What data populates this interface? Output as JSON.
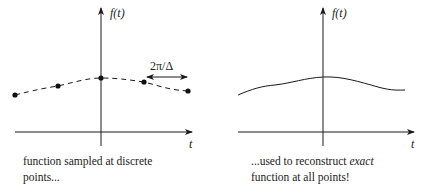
{
  "panels": [
    {
      "id": "sampled",
      "y_axis_label": "f(t)",
      "x_axis_label": "t",
      "spacing_label": "2π/Δ",
      "caption_line1": "function sampled at discrete",
      "caption_line2": "points...",
      "style": "dashed curve with sample dots",
      "sample_points": [
        {
          "x": 15,
          "y": 95
        },
        {
          "x": 58,
          "y": 86
        },
        {
          "x": 101,
          "y": 78
        },
        {
          "x": 144,
          "y": 82
        },
        {
          "x": 188,
          "y": 91
        }
      ]
    },
    {
      "id": "reconstructed",
      "y_axis_label": "f(t)",
      "x_axis_label": "t",
      "caption_line1_prefix": "...used to reconstruct ",
      "caption_line1_emph": "exact",
      "caption_line2": "function at all points!",
      "style": "solid continuous curve"
    }
  ],
  "colors": {
    "ink": "#1a1a1a",
    "background": "#ffffff"
  }
}
